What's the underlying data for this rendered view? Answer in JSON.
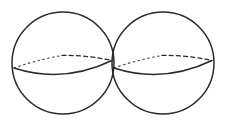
{
  "figure": {
    "background_color": "#ffffff",
    "stroke_color": "#2a2a2a",
    "canvas": {
      "width": 226,
      "height": 123
    },
    "shapes": [
      {
        "name": "left-sphere",
        "type": "sphere",
        "outline": {
          "cx": 63,
          "cy": 63,
          "r": 51
        },
        "equator": {
          "left_vertex": {
            "x": 14,
            "y": 68
          },
          "right_vertex": {
            "x": 112,
            "y": 60
          },
          "front_arc_sag": 15,
          "back_arc_rise": 11,
          "front_style": "solid",
          "back_style": "dashed"
        }
      },
      {
        "name": "right-sphere",
        "type": "sphere",
        "outline": {
          "cx": 163,
          "cy": 63,
          "r": 51
        },
        "equator": {
          "left_vertex": {
            "x": 114,
            "y": 68
          },
          "right_vertex": {
            "x": 212,
            "y": 60
          },
          "front_arc_sag": 15,
          "back_arc_rise": 11,
          "front_style": "solid",
          "back_style": "dashed"
        }
      }
    ],
    "tangency": {
      "x": 113,
      "y": 63,
      "description": "spheres meet at a single point"
    },
    "labels": [],
    "annotations": []
  }
}
